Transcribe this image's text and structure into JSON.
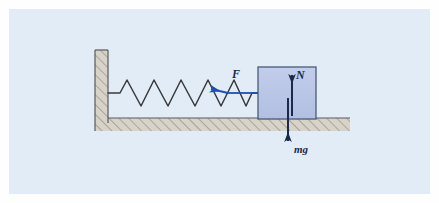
{
  "figure": {
    "background_color": "#e2ecf7",
    "frame_color": "#ffffff",
    "width": 439,
    "height": 203
  },
  "colors": {
    "background": "#e2ecf7",
    "outer_frame": "#fdfdfd",
    "hatch_fill": "#d6d2c8",
    "hatch_line": "#8d8a82",
    "structure_outline": "#5a5a58",
    "spring_line": "#3a3a3c",
    "block_fill": "#b6c3e4",
    "block_outline": "#4a5a7a",
    "force_arrow_blue": "#1f4fb5",
    "force_arrow_navy": "#1b2a49",
    "label_text": "#1b2a49"
  },
  "wall": {
    "name": "vertical wall",
    "x": 95,
    "y": 50,
    "width": 13,
    "height": 73,
    "hatching": "diagonal"
  },
  "floor": {
    "name": "ground surface",
    "x": 95,
    "y": 118,
    "width": 255,
    "height": 13,
    "hatching": "diagonal"
  },
  "spring": {
    "name": "coil spring",
    "anchor_x": 108,
    "anchor_y": 93,
    "end_x": 258,
    "end_y": 93,
    "coil_count": 5,
    "amplitude": 13
  },
  "block": {
    "name": "block",
    "x": 258,
    "y": 67,
    "width": 58,
    "height": 52
  },
  "forces": [
    {
      "id": "applied-force",
      "label": "F",
      "direction": "left",
      "color": "#1f4fb5",
      "tail_x": 258,
      "tail_y": 93,
      "head_x": 206,
      "head_y": 90,
      "label_x": 233,
      "label_y": 76
    },
    {
      "id": "normal-force",
      "label": "N",
      "direction": "up",
      "color": "#1b2a49",
      "tail_x": 292,
      "tail_y": 116,
      "head_x": 292,
      "head_y": 70,
      "label_x": 297,
      "label_y": 76
    },
    {
      "id": "weight-force",
      "label": "mg",
      "direction": "down",
      "color": "#1b2a49",
      "tail_x": 288,
      "tail_y": 98,
      "head_x": 288,
      "head_y": 146,
      "label_x": 293,
      "label_y": 152
    }
  ]
}
